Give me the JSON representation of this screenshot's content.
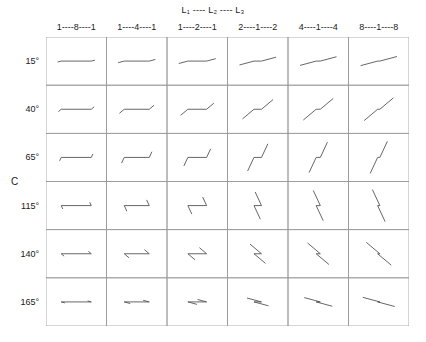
{
  "figure": {
    "legend_top": "L₁ ---- L₂ ---- L₃",
    "row_axis_label": "C",
    "column_headers": [
      "1----8----1",
      "1----4----1",
      "1----2----1",
      "2----1----2",
      "4----1----4",
      "8----1----8"
    ],
    "row_headers": [
      "15°",
      "40°",
      "65°",
      "115°",
      "140°",
      "165°"
    ],
    "colors": {
      "grid_line": "#9a9a9a",
      "glyph_line": "#555555",
      "background": "#ffffff",
      "text": "#1a1a1a"
    }
  },
  "chart_data": {
    "type": "scatter",
    "title": "",
    "subtitle": "L₁ ---- L₂ ---- L₃",
    "xlabel": "",
    "ylabel": "C",
    "grid": true,
    "legend_position": "top",
    "x": [
      "1----8----1",
      "1----4----1",
      "1----2----1",
      "2----1----2",
      "4----1----4",
      "8----1----8"
    ],
    "x_ratios": [
      [
        1,
        8,
        1
      ],
      [
        1,
        4,
        1
      ],
      [
        1,
        2,
        1
      ],
      [
        2,
        1,
        2
      ],
      [
        4,
        1,
        4
      ],
      [
        8,
        1,
        8
      ]
    ],
    "y": [
      15,
      40,
      65,
      115,
      140,
      165
    ],
    "y_tick_labels": [
      "15°",
      "40°",
      "65°",
      "115°",
      "140°",
      "165°"
    ],
    "cell_glyph_description": "Each cell draws a three-segment polyline: outer segments at the row angle C, middle segment horizontal; the relative lengths of the three segments follow the column ratio L1----L2----L3.",
    "cells": [
      {
        "row": "15°",
        "col": "1----8----1",
        "angle_deg": 15,
        "segments": [
          1,
          8,
          1
        ]
      },
      {
        "row": "15°",
        "col": "1----4----1",
        "angle_deg": 15,
        "segments": [
          1,
          4,
          1
        ]
      },
      {
        "row": "15°",
        "col": "1----2----1",
        "angle_deg": 15,
        "segments": [
          1,
          2,
          1
        ]
      },
      {
        "row": "15°",
        "col": "2----1----2",
        "angle_deg": 15,
        "segments": [
          2,
          1,
          2
        ]
      },
      {
        "row": "15°",
        "col": "4----1----4",
        "angle_deg": 15,
        "segments": [
          4,
          1,
          4
        ]
      },
      {
        "row": "15°",
        "col": "8----1----8",
        "angle_deg": 15,
        "segments": [
          8,
          1,
          8
        ]
      },
      {
        "row": "40°",
        "col": "1----8----1",
        "angle_deg": 40,
        "segments": [
          1,
          8,
          1
        ]
      },
      {
        "row": "40°",
        "col": "1----4----1",
        "angle_deg": 40,
        "segments": [
          1,
          4,
          1
        ]
      },
      {
        "row": "40°",
        "col": "1----2----1",
        "angle_deg": 40,
        "segments": [
          1,
          2,
          1
        ]
      },
      {
        "row": "40°",
        "col": "2----1----2",
        "angle_deg": 40,
        "segments": [
          2,
          1,
          2
        ]
      },
      {
        "row": "40°",
        "col": "4----1----4",
        "angle_deg": 40,
        "segments": [
          4,
          1,
          4
        ]
      },
      {
        "row": "40°",
        "col": "8----1----8",
        "angle_deg": 40,
        "segments": [
          8,
          1,
          8
        ]
      },
      {
        "row": "65°",
        "col": "1----8----1",
        "angle_deg": 65,
        "segments": [
          1,
          8,
          1
        ]
      },
      {
        "row": "65°",
        "col": "1----4----1",
        "angle_deg": 65,
        "segments": [
          1,
          4,
          1
        ]
      },
      {
        "row": "65°",
        "col": "1----2----1",
        "angle_deg": 65,
        "segments": [
          1,
          2,
          1
        ]
      },
      {
        "row": "65°",
        "col": "2----1----2",
        "angle_deg": 65,
        "segments": [
          2,
          1,
          2
        ]
      },
      {
        "row": "65°",
        "col": "4----1----4",
        "angle_deg": 65,
        "segments": [
          4,
          1,
          4
        ]
      },
      {
        "row": "65°",
        "col": "8----1----8",
        "angle_deg": 65,
        "segments": [
          8,
          1,
          8
        ]
      },
      {
        "row": "115°",
        "col": "1----8----1",
        "angle_deg": 115,
        "segments": [
          1,
          8,
          1
        ]
      },
      {
        "row": "115°",
        "col": "1----4----1",
        "angle_deg": 115,
        "segments": [
          1,
          4,
          1
        ]
      },
      {
        "row": "115°",
        "col": "1----2----1",
        "angle_deg": 115,
        "segments": [
          1,
          2,
          1
        ]
      },
      {
        "row": "115°",
        "col": "2----1----2",
        "angle_deg": 115,
        "segments": [
          2,
          1,
          2
        ]
      },
      {
        "row": "115°",
        "col": "4----1----4",
        "angle_deg": 115,
        "segments": [
          4,
          1,
          4
        ]
      },
      {
        "row": "115°",
        "col": "8----1----8",
        "angle_deg": 115,
        "segments": [
          8,
          1,
          8
        ]
      },
      {
        "row": "140°",
        "col": "1----8----1",
        "angle_deg": 140,
        "segments": [
          1,
          8,
          1
        ]
      },
      {
        "row": "140°",
        "col": "1----4----1",
        "angle_deg": 140,
        "segments": [
          1,
          4,
          1
        ]
      },
      {
        "row": "140°",
        "col": "1----2----1",
        "angle_deg": 140,
        "segments": [
          1,
          2,
          1
        ]
      },
      {
        "row": "140°",
        "col": "2----1----2",
        "angle_deg": 140,
        "segments": [
          2,
          1,
          2
        ]
      },
      {
        "row": "140°",
        "col": "4----1----4",
        "angle_deg": 140,
        "segments": [
          4,
          1,
          4
        ]
      },
      {
        "row": "140°",
        "col": "8----1----8",
        "angle_deg": 140,
        "segments": [
          8,
          1,
          8
        ]
      },
      {
        "row": "165°",
        "col": "1----8----1",
        "angle_deg": 165,
        "segments": [
          1,
          8,
          1
        ]
      },
      {
        "row": "165°",
        "col": "1----4----1",
        "angle_deg": 165,
        "segments": [
          1,
          4,
          1
        ]
      },
      {
        "row": "165°",
        "col": "1----2----1",
        "angle_deg": 165,
        "segments": [
          1,
          2,
          1
        ]
      },
      {
        "row": "165°",
        "col": "2----1----2",
        "angle_deg": 165,
        "segments": [
          2,
          1,
          2
        ]
      },
      {
        "row": "165°",
        "col": "4----1----4",
        "angle_deg": 165,
        "segments": [
          4,
          1,
          4
        ]
      },
      {
        "row": "165°",
        "col": "8----1----8",
        "angle_deg": 165,
        "segments": [
          8,
          1,
          8
        ]
      }
    ]
  }
}
